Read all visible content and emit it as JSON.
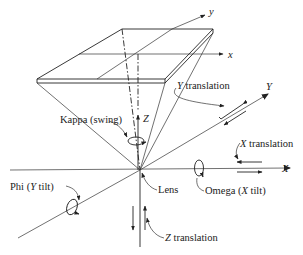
{
  "diagram": {
    "type": "camera-orientation-axes",
    "axes": {
      "image_x": "x",
      "image_y": "y",
      "ground_X": "X",
      "ground_Y": "Y",
      "ground_Z": "Z"
    },
    "labels": {
      "kappa": "Kappa (swing)",
      "phi_prefix": "Phi (",
      "phi_axis": "Y",
      "phi_suffix": " tilt)",
      "omega_prefix": "Omega (",
      "omega_axis": "X",
      "omega_suffix": " tilt)",
      "lens": "Lens",
      "x_translation_axis": "X",
      "x_translation": " translation",
      "y_translation_axis": "Y",
      "y_translation": " translation",
      "z_translation_axis": "Z",
      "z_translation": " translation"
    },
    "colors": {
      "line": "#222222",
      "background": "#ffffff"
    }
  }
}
